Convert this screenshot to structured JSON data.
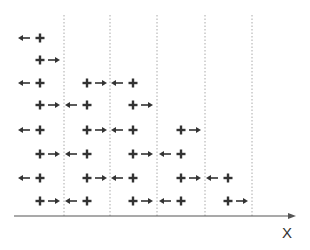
{
  "diagram": {
    "axis_label": "X",
    "axis": {
      "x1": 14,
      "x2": 296,
      "y": 216,
      "color": "#555555"
    },
    "dividers": {
      "xs": [
        64,
        110,
        157,
        205,
        252
      ],
      "y1": 15,
      "y2": 216,
      "color": "#aaaaaa"
    },
    "glyph_color": "#333333",
    "row_ys": [
      38,
      60,
      83,
      105,
      130,
      154,
      178,
      201
    ],
    "rows": [
      [
        {
          "type": "left-plus",
          "plus_x": 40
        }
      ],
      [
        {
          "type": "plus-right",
          "plus_x": 40
        }
      ],
      [
        {
          "type": "left-plus",
          "plus_x": 40
        },
        {
          "type": "plus-right",
          "plus_x": 87
        },
        {
          "type": "left-plus",
          "plus_x": 133
        }
      ],
      [
        {
          "type": "plus-right",
          "plus_x": 40
        },
        {
          "type": "left-plus",
          "plus_x": 87
        },
        {
          "type": "plus-right",
          "plus_x": 133
        }
      ],
      [
        {
          "type": "left-plus",
          "plus_x": 40
        },
        {
          "type": "plus-right",
          "plus_x": 87
        },
        {
          "type": "left-plus",
          "plus_x": 133
        },
        {
          "type": "plus-right",
          "plus_x": 181
        }
      ],
      [
        {
          "type": "plus-right",
          "plus_x": 40
        },
        {
          "type": "left-plus",
          "plus_x": 87
        },
        {
          "type": "plus-right",
          "plus_x": 133
        },
        {
          "type": "left-plus",
          "plus_x": 181
        }
      ],
      [
        {
          "type": "left-plus",
          "plus_x": 40
        },
        {
          "type": "plus-right",
          "plus_x": 87
        },
        {
          "type": "left-plus",
          "plus_x": 133
        },
        {
          "type": "plus-right",
          "plus_x": 181
        },
        {
          "type": "left-plus",
          "plus_x": 228
        }
      ],
      [
        {
          "type": "plus-right",
          "plus_x": 40
        },
        {
          "type": "left-plus",
          "plus_x": 87
        },
        {
          "type": "plus-right",
          "plus_x": 133
        },
        {
          "type": "left-plus",
          "plus_x": 181
        },
        {
          "type": "plus-right",
          "plus_x": 228
        }
      ]
    ]
  }
}
